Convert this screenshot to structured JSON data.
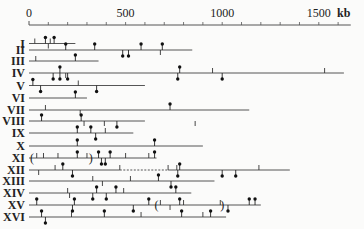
{
  "scale": {
    "unit": "kb",
    "ticks": [
      {
        "value": 0,
        "label": "0"
      },
      {
        "value": 500,
        "label": "500"
      },
      {
        "value": 1000,
        "label": "1000"
      },
      {
        "value": 1500,
        "label": "1500"
      }
    ],
    "minor_step": 100,
    "max": 1650
  },
  "chromosomes": [
    {
      "label": "I",
      "length": 240,
      "marks": [
        {
          "kb": 30,
          "type": "bar"
        },
        {
          "kb": 85,
          "type": "pin-up"
        },
        {
          "kb": 110,
          "type": "bar"
        },
        {
          "kb": 130,
          "type": "pin-up"
        },
        {
          "kb": 100,
          "type": "bar-down"
        }
      ]
    },
    {
      "label": "II",
      "length": 845,
      "marks": [
        {
          "kb": 190,
          "type": "pin-up"
        },
        {
          "kb": 340,
          "type": "pin-up"
        },
        {
          "kb": 485,
          "type": "pin-down"
        },
        {
          "kb": 515,
          "type": "pin-down"
        },
        {
          "kb": 580,
          "type": "pin-up"
        },
        {
          "kb": 690,
          "type": "pin-up"
        },
        {
          "kb": 680,
          "type": "bar-down"
        }
      ]
    },
    {
      "label": "III",
      "length": 360,
      "marks": [
        {
          "kb": 35,
          "type": "bar"
        },
        {
          "kb": 240,
          "type": "pin-up"
        }
      ]
    },
    {
      "label": "IV",
      "length": 1630,
      "marks": [
        {
          "kb": 125,
          "type": "pin-down"
        },
        {
          "kb": 160,
          "type": "pin-up"
        },
        {
          "kb": 160,
          "type": "pin-down"
        },
        {
          "kb": 200,
          "type": "pin-down"
        },
        {
          "kb": 190,
          "type": "bar-down"
        },
        {
          "kb": 780,
          "type": "pin-up"
        },
        {
          "kb": 770,
          "type": "pin-down"
        },
        {
          "kb": 950,
          "type": "bar"
        },
        {
          "kb": 1000,
          "type": "pin-down"
        },
        {
          "kb": 1530,
          "type": "bar"
        }
      ]
    },
    {
      "label": "V",
      "length": 600,
      "marks": [
        {
          "kb": 20,
          "type": "pin-up"
        },
        {
          "kb": 60,
          "type": "pin-down"
        },
        {
          "kb": 255,
          "type": "bar"
        },
        {
          "kb": 350,
          "type": "pin-down"
        }
      ]
    },
    {
      "label": "VI",
      "length": 300,
      "marks": [
        {
          "kb": 240,
          "type": "pin-up"
        }
      ]
    },
    {
      "label": "VII",
      "length": 1140,
      "marks": [
        {
          "kb": 85,
          "type": "bar"
        },
        {
          "kb": 730,
          "type": "pin-up"
        },
        {
          "kb": 265,
          "type": "bar-down"
        }
      ]
    },
    {
      "label": "VIII",
      "length": 600,
      "marks": [
        {
          "kb": 65,
          "type": "pin-up"
        },
        {
          "kb": 270,
          "type": "pin-up"
        },
        {
          "kb": 285,
          "type": "bar-down"
        },
        {
          "kb": 390,
          "type": "bar-down"
        },
        {
          "kb": 455,
          "type": "pin-down"
        },
        {
          "kb": 860,
          "type": "bar-down"
        }
      ]
    },
    {
      "label": "IX",
      "length": 540,
      "marks": [
        {
          "kb": 250,
          "type": "pin-up"
        },
        {
          "kb": 320,
          "type": "pin-up"
        },
        {
          "kb": 345,
          "type": "pin-down"
        },
        {
          "kb": 395,
          "type": "bar"
        }
      ]
    },
    {
      "label": "X",
      "length": 900,
      "marks": [
        {
          "kb": 250,
          "type": "pin-up"
        },
        {
          "kb": 650,
          "type": "pin-up"
        }
      ]
    },
    {
      "label": "XI",
      "length": 660,
      "marks": [
        {
          "kb": 15,
          "type": "paren-open"
        },
        {
          "kb": 40,
          "type": "bar"
        },
        {
          "kb": 75,
          "type": "bar"
        },
        {
          "kb": 150,
          "type": "bar"
        },
        {
          "kb": 250,
          "type": "pin-up"
        },
        {
          "kb": 300,
          "type": "bar"
        },
        {
          "kb": 320,
          "type": "paren-close"
        },
        {
          "kb": 360,
          "type": "pin-up"
        },
        {
          "kb": 375,
          "type": "pin-down"
        },
        {
          "kb": 395,
          "type": "pin-down"
        },
        {
          "kb": 420,
          "type": "pin-up"
        },
        {
          "kb": 500,
          "type": "bar"
        },
        {
          "kb": 620,
          "type": "bar"
        },
        {
          "kb": 650,
          "type": "pin-up"
        }
      ]
    },
    {
      "label": "XII",
      "length": 1350,
      "dashed": [
        470,
        720
      ],
      "marks": [
        {
          "kb": 50,
          "type": "bar-down"
        },
        {
          "kb": 135,
          "type": "bar"
        },
        {
          "kb": 175,
          "type": "pin-up"
        },
        {
          "kb": 225,
          "type": "pin-down"
        },
        {
          "kb": 470,
          "type": "bar"
        },
        {
          "kb": 720,
          "type": "bar"
        },
        {
          "kb": 765,
          "type": "bar"
        },
        {
          "kb": 780,
          "type": "pin-up"
        },
        {
          "kb": 770,
          "type": "pin-down"
        },
        {
          "kb": 1000,
          "type": "pin-down"
        },
        {
          "kb": 1070,
          "type": "pin-down"
        },
        {
          "kb": 1190,
          "type": "bar"
        }
      ]
    },
    {
      "label": "XIII",
      "length": 960,
      "marks": [
        {
          "kb": 330,
          "type": "bar"
        },
        {
          "kb": 525,
          "type": "bar"
        },
        {
          "kb": 670,
          "type": "pin-up"
        },
        {
          "kb": 735,
          "type": "pin-down"
        },
        {
          "kb": 380,
          "type": "bar-down"
        }
      ]
    },
    {
      "label": "XIV",
      "length": 840,
      "marks": [
        {
          "kb": 200,
          "type": "bar"
        },
        {
          "kb": 210,
          "type": "bar-down"
        },
        {
          "kb": 350,
          "type": "pin-up"
        },
        {
          "kb": 330,
          "type": "pin-down"
        },
        {
          "kb": 400,
          "type": "pin-down"
        },
        {
          "kb": 450,
          "type": "pin-up"
        },
        {
          "kb": 490,
          "type": "bar"
        },
        {
          "kb": 760,
          "type": "pin-up"
        }
      ]
    },
    {
      "label": "XV",
      "length": 1200,
      "marks": [
        {
          "kb": 40,
          "type": "pin-up"
        },
        {
          "kb": 235,
          "type": "pin-up"
        },
        {
          "kb": 225,
          "type": "pin-down"
        },
        {
          "kb": 620,
          "type": "pin-up"
        },
        {
          "kb": 540,
          "type": "pin-down"
        },
        {
          "kb": 660,
          "type": "paren-open"
        },
        {
          "kb": 680,
          "type": "bar"
        },
        {
          "kb": 730,
          "type": "bar-down"
        },
        {
          "kb": 780,
          "type": "pin-up"
        },
        {
          "kb": 800,
          "type": "bar"
        },
        {
          "kb": 990,
          "type": "bar"
        },
        {
          "kb": 1000,
          "type": "paren-close"
        },
        {
          "kb": 1030,
          "type": "pin-down"
        },
        {
          "kb": 1140,
          "type": "pin-up"
        },
        {
          "kb": 1170,
          "type": "pin-up"
        }
      ]
    },
    {
      "label": "XVI",
      "length": 1020,
      "marks": [
        {
          "kb": 65,
          "type": "pin-up"
        },
        {
          "kb": 85,
          "type": "pin-down"
        },
        {
          "kb": 220,
          "type": "bar"
        },
        {
          "kb": 390,
          "type": "pin-up"
        },
        {
          "kb": 580,
          "type": "bar"
        },
        {
          "kb": 790,
          "type": "pin-up"
        },
        {
          "kb": 900,
          "type": "bar"
        },
        {
          "kb": 940,
          "type": "pin-up"
        }
      ]
    }
  ],
  "legend": {
    "pin": "marker with dot",
    "bar": "tick mark",
    "paren": "bracketed region"
  }
}
